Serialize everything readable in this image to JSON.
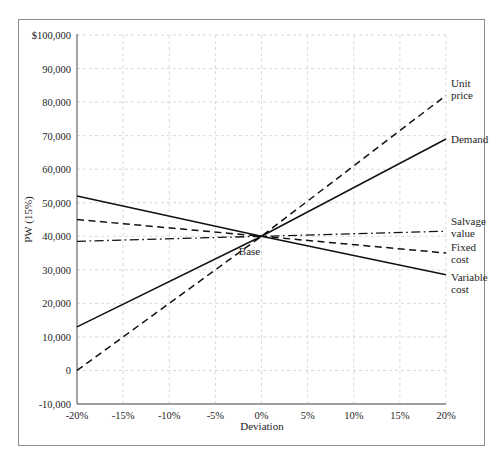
{
  "figure": {
    "top_caption": "",
    "base_annotation": "Base"
  },
  "chart_data": {
    "type": "line",
    "title": "",
    "subtitle": "",
    "xlabel": "Deviation",
    "ylabel": "PW (15%)",
    "x": [
      -20,
      -15,
      -10,
      -5,
      0,
      5,
      10,
      15,
      20
    ],
    "xtick_labels": [
      "-20%",
      "-15%",
      "-10%",
      "-5%",
      "0%",
      "5%",
      "10%",
      "15%",
      "20%"
    ],
    "xlim": [
      -20,
      20
    ],
    "ylim": [
      -10000,
      100000
    ],
    "ytick_values": [
      100000,
      90000,
      80000,
      70000,
      60000,
      50000,
      40000,
      30000,
      20000,
      10000,
      0,
      -10000
    ],
    "ytick_labels": [
      "$100,000",
      "90,000",
      "80,000",
      "70,000",
      "60,000",
      "50,000",
      "40,000",
      "30,000",
      "20,000",
      "10,000",
      "0",
      "-10,000"
    ],
    "grid": true,
    "legend_position": "right-inline",
    "base_point": {
      "x": 0,
      "y": 40000,
      "label": "Base"
    },
    "series": [
      {
        "name": "Unit price",
        "label_lines": [
          "Unit",
          "price"
        ],
        "style": "dashed",
        "color": "#111111",
        "x": [
          -20,
          0,
          20
        ],
        "values": [
          0,
          40000,
          82000
        ]
      },
      {
        "name": "Demand",
        "label_lines": [
          "Demand"
        ],
        "style": "solid",
        "color": "#111111",
        "x": [
          -20,
          0,
          20
        ],
        "values": [
          13000,
          40000,
          69000
        ]
      },
      {
        "name": "Salvage value",
        "label_lines": [
          "Salvage",
          "value"
        ],
        "style": "dashdot",
        "color": "#111111",
        "x": [
          -20,
          0,
          20
        ],
        "values": [
          38500,
          40000,
          41500
        ]
      },
      {
        "name": "Fixed cost",
        "label_lines": [
          "Fixed",
          "cost"
        ],
        "style": "dashed",
        "color": "#111111",
        "x": [
          -20,
          0,
          20
        ],
        "values": [
          45000,
          40000,
          35000
        ]
      },
      {
        "name": "Variable cost",
        "label_lines": [
          "Variable",
          "cost"
        ],
        "style": "solid",
        "color": "#111111",
        "x": [
          -20,
          0,
          20
        ],
        "values": [
          52000,
          40000,
          28500
        ]
      }
    ]
  }
}
